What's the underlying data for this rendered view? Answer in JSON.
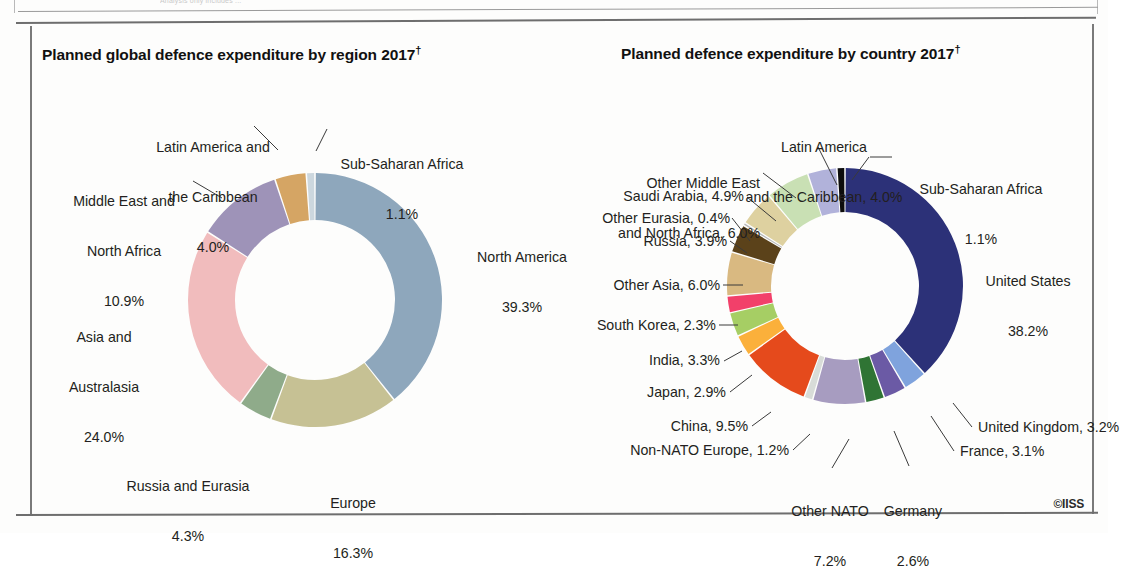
{
  "page": {
    "top_ghost_text": "Analysis only includes ...",
    "credit": "©IISS"
  },
  "left_chart": {
    "title": "Planned global defence expenditure by region 2017",
    "title_dagger": "†",
    "labels": {
      "north_america": {
        "name": "North America",
        "value": "39.3%"
      },
      "europe": {
        "name": "Europe",
        "value": "16.3%"
      },
      "russia_eurasia": {
        "name": "Russia and Eurasia",
        "value": "4.3%"
      },
      "asia_australasia_l1": "Asia and",
      "asia_australasia_l2": "Australasia",
      "asia_australasia_val": "24.0%",
      "mena_l1": "Middle East and",
      "mena_l2": "North Africa",
      "mena_val": "10.9%",
      "latam_l1": "Latin America and",
      "latam_l2": "the Caribbean",
      "latam_val": "4.0%",
      "ssa_name": "Sub-Saharan Africa",
      "ssa_val": "1.1%"
    }
  },
  "right_chart": {
    "title": "Planned defence expenditure by country 2017",
    "title_dagger": "†",
    "labels": {
      "united_states_l1": "United States",
      "united_states_l2": "38.2%",
      "united_kingdom": "United Kingdom, 3.2%",
      "france": "France, 3.1%",
      "germany_l1": "Germany",
      "germany_l2": "2.6%",
      "other_nato_l1": "Other NATO",
      "other_nato_l2": "7.2%",
      "non_nato_europe": "Non-NATO Europe, 1.2%",
      "china": "China, 9.5%",
      "japan": "Japan, 2.9%",
      "india": "India, 3.3%",
      "south_korea": "South Korea, 2.3%",
      "other_asia": "Other Asia, 6.0%",
      "russia": "Russia, 3.9%",
      "other_eurasia": "Other Eurasia, 0.4%",
      "saudi_arabia": "Saudi Arabia, 4.9%",
      "other_mena_l1": "Other Middle East",
      "other_mena_l2": "and North Africa, 6.0%",
      "latam_l1": "Latin America",
      "latam_l2": "and the Caribbean, 4.0%",
      "ssa_l1": "Sub-Saharan Africa",
      "ssa_l2": "1.1%"
    }
  },
  "chart_data": [
    {
      "type": "pie",
      "variant": "donut",
      "title": "Planned global defence expenditure by region 2017†",
      "unit": "percent",
      "center": [
        315,
        300
      ],
      "outer_radius": 127,
      "inner_radius": 80,
      "start_angle_deg": 0,
      "direction": "clockwise",
      "labels": [
        "North America",
        "Europe",
        "Russia and Eurasia",
        "Asia and Australasia",
        "Middle East and North Africa",
        "Latin America and the Caribbean",
        "Sub-Saharan Africa"
      ],
      "values": [
        39.3,
        16.3,
        4.3,
        24.0,
        10.9,
        4.0,
        1.1
      ],
      "colors": [
        "#8ea7bc",
        "#c6c194",
        "#8fab8a",
        "#f1bcbd",
        "#9e93b8",
        "#d5a564",
        "#ccd7de"
      ],
      "legend": "labels-with-leader-lines",
      "grid": false
    },
    {
      "type": "pie",
      "variant": "donut",
      "title": "Planned defence expenditure by country 2017†",
      "unit": "percent",
      "center": [
        845,
        286
      ],
      "outer_radius": 118,
      "inner_radius": 74,
      "start_angle_deg": 0,
      "direction": "clockwise",
      "labels": [
        "United States",
        "United Kingdom",
        "France",
        "Germany",
        "Other NATO",
        "Non-NATO Europe",
        "China",
        "Japan",
        "India",
        "South Korea",
        "Other Asia",
        "Russia",
        "Other Eurasia",
        "Saudi Arabia",
        "Other Middle East and North Africa",
        "Latin America and the Caribbean",
        "Sub-Saharan Africa"
      ],
      "values": [
        38.2,
        3.2,
        3.1,
        2.6,
        7.2,
        1.2,
        9.5,
        2.9,
        3.3,
        2.3,
        6.0,
        3.9,
        0.4,
        4.9,
        6.0,
        4.0,
        1.1
      ],
      "colors": [
        "#2c3178",
        "#7fa3dd",
        "#6b5aa5",
        "#2f7434",
        "#a79cc0",
        "#d8dcd8",
        "#e54a1c",
        "#fbb03b",
        "#a6ce64",
        "#f2406a",
        "#d9b981",
        "#5b421a",
        "#b8b8b8",
        "#ded1a0",
        "#c9e0b4",
        "#b1b2da",
        "#0d0d0d"
      ],
      "legend": "labels-with-leader-lines",
      "grid": false
    }
  ]
}
